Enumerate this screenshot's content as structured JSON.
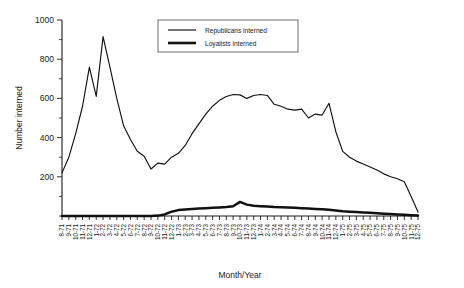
{
  "chart_data": {
    "type": "line",
    "title": "",
    "xlabel": "Month/Year",
    "ylabel": "Number interned",
    "ylim": [
      0,
      1000
    ],
    "yticks": [
      200,
      400,
      600,
      800,
      1000
    ],
    "ytick_labels": [
      "200",
      "400",
      "600",
      "800",
      "1000"
    ],
    "minor_ticks": true,
    "grid": false,
    "legend_position": "top-right",
    "categories": [
      "8-71",
      "9-71",
      "10-71",
      "11-71",
      "12-71",
      "1-72",
      "2-72",
      "3-72",
      "4-72",
      "5-72",
      "6-72",
      "7-72",
      "8-72",
      "9-72",
      "10-72",
      "11-72",
      "12-72",
      "1-73",
      "2-73",
      "3-73",
      "4-73",
      "5-73",
      "6-73",
      "7-73",
      "8-73",
      "9-73",
      "10-73",
      "11-73",
      "12-73",
      "1-74",
      "2-74",
      "3-74",
      "4-74",
      "5-74",
      "6-74",
      "7-74",
      "8-74",
      "9-74",
      "10-74",
      "11-74",
      "12-74",
      "1-75",
      "2-75",
      "3-75",
      "4-75",
      "5-75",
      "6-75",
      "7-75",
      "8-75",
      "9-75",
      "10-75",
      "11-75",
      "12-75"
    ],
    "series": [
      {
        "name": "Republicans interned",
        "color": "#111111",
        "values": [
          220,
          300,
          420,
          560,
          760,
          610,
          915,
          760,
          600,
          460,
          390,
          330,
          305,
          240,
          270,
          265,
          300,
          320,
          360,
          420,
          470,
          520,
          560,
          590,
          610,
          620,
          618,
          600,
          615,
          620,
          615,
          570,
          560,
          545,
          540,
          545,
          500,
          520,
          515,
          575,
          430,
          330,
          300,
          280,
          265,
          250,
          235,
          215,
          200,
          190,
          175,
          100,
          20
        ]
      },
      {
        "name": "Loyalists interned",
        "color": "#111111",
        "values": [
          0,
          0,
          0,
          0,
          0,
          0,
          0,
          0,
          0,
          0,
          0,
          0,
          0,
          0,
          2,
          8,
          22,
          30,
          33,
          36,
          38,
          40,
          42,
          44,
          46,
          50,
          72,
          58,
          52,
          50,
          48,
          46,
          45,
          44,
          42,
          40,
          38,
          36,
          34,
          32,
          28,
          24,
          22,
          20,
          18,
          16,
          14,
          12,
          10,
          8,
          6,
          4,
          2
        ]
      }
    ],
    "legend": [
      {
        "label": "Republicans interned",
        "style": "thin-line"
      },
      {
        "label": "Loyalists interned",
        "style": "thick-line"
      }
    ]
  },
  "axes": {
    "y_axis_title": "Number interned",
    "x_axis_title": "Month/Year"
  }
}
